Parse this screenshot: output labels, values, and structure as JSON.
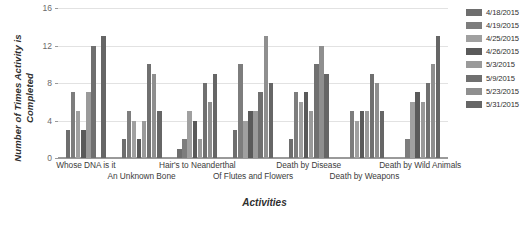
{
  "chart_data": {
    "type": "bar",
    "title": "",
    "xlabel": "Activities",
    "ylabel": "Number of Times Activity is Completed",
    "ylabel_lines": [
      "Number of Times Activity is",
      "Completed"
    ],
    "ylim": [
      0,
      16
    ],
    "yticks": [
      0,
      4,
      8,
      12,
      16
    ],
    "ytick_labels": [
      "0",
      "4",
      "8",
      "12",
      "16"
    ],
    "grid": true,
    "legend_position": "right",
    "categories": [
      "Whose DNA is it",
      "An Unknown Bone",
      "Hair's to Neanderthal",
      "Of Flutes and Flowers",
      "Death by Disease",
      "Death by Weapons",
      "Death by Wild Animals"
    ],
    "series": [
      {
        "name": "4/18/2015",
        "color": "#6e6e6e",
        "values": [
          3,
          2,
          1,
          3,
          2,
          0,
          0
        ]
      },
      {
        "name": "4/19/2015",
        "color": "#7d7d7d",
        "values": [
          7,
          5,
          2,
          10,
          7,
          5,
          2
        ]
      },
      {
        "name": "4/25/2015",
        "color": "#a0a0a0",
        "values": [
          5,
          4,
          5,
          4,
          6,
          4,
          6
        ]
      },
      {
        "name": "4/26/2015",
        "color": "#5a5a5a",
        "values": [
          3,
          2,
          4,
          5,
          7,
          5,
          7
        ]
      },
      {
        "name": "5/3/2015",
        "color": "#9a9a9a",
        "values": [
          7,
          4,
          2,
          5,
          5,
          5,
          6
        ]
      },
      {
        "name": "5/9/2015",
        "color": "#707070",
        "values": [
          12,
          10,
          8,
          7,
          10,
          9,
          8
        ]
      },
      {
        "name": "5/23/2015",
        "color": "#8f8f8f",
        "values": [
          0,
          9,
          6,
          13,
          12,
          8,
          10
        ]
      },
      {
        "name": "5/31/2015",
        "color": "#666666",
        "values": [
          13,
          5,
          9,
          8,
          9,
          5,
          13
        ]
      }
    ]
  },
  "legend": {
    "items": [
      {
        "label": "4/18/2015"
      },
      {
        "label": "4/19/2015"
      },
      {
        "label": "4/25/2015"
      },
      {
        "label": "4/26/2015"
      },
      {
        "label": "5/3/2015"
      },
      {
        "label": "5/9/2015"
      },
      {
        "label": "5/23/2015"
      },
      {
        "label": "5/31/2015"
      }
    ]
  },
  "axes": {
    "x_title": "Activities",
    "y_title_line1": "Number of Times Activity is",
    "y_title_line2": "Completed"
  }
}
